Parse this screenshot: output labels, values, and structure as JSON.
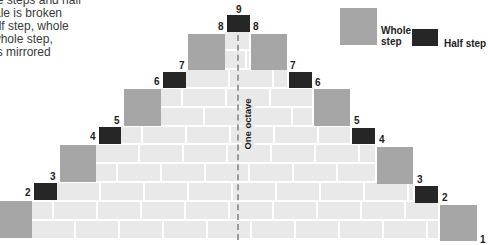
{
  "intro_text": {
    "lines": [
      "whole steps and half",
      "e scale is broken",
      "p, half step, whole",
      "ep, whole step,",
      "this is mirrored"
    ]
  },
  "legend": {
    "whole_label_line1": "Whole",
    "whole_label_line2": "step",
    "half_label": "Half step",
    "whole_color": "#a6a6a6",
    "half_color": "#262626"
  },
  "octave_label": "One octave",
  "steps_left": [
    {
      "type": "whole",
      "label": "1"
    },
    {
      "type": "half",
      "label": "2"
    },
    {
      "type": "whole",
      "label": "3"
    },
    {
      "type": "half",
      "label": "4"
    },
    {
      "type": "whole",
      "label": "5"
    },
    {
      "type": "half",
      "label": "6"
    },
    {
      "type": "whole",
      "label": "7"
    }
  ],
  "labels": {
    "n1": "1",
    "n2": "2",
    "n3": "3",
    "n4": "4",
    "n5": "5",
    "n6": "6",
    "n7": "7",
    "n8": "8",
    "n9": "9"
  },
  "colors": {
    "brick": "#e9e9e9",
    "mortar": "#ffffff",
    "whole_step": "#a6a6a6",
    "half_step": "#262626"
  }
}
